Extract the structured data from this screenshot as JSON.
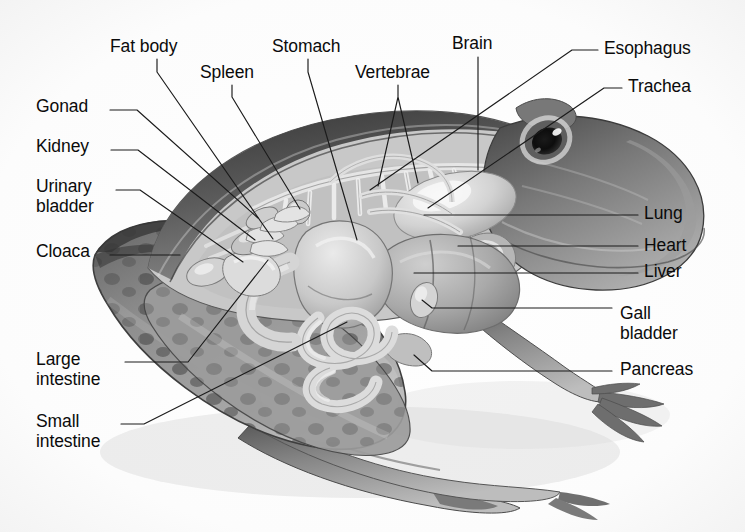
{
  "figure": {
    "view": "lateral dissection, facing right",
    "background_color": "#fdfdfd",
    "label_color": "#0b0b0b",
    "leader_color": "#1b1b1b",
    "style": "grayscale airbrush illustration"
  },
  "labels": [
    {
      "id": "fat-body",
      "text": "Fat body",
      "x": 110,
      "y": 36,
      "align": "left",
      "leader": "M 157 59 L 157 72 L 273 239"
    },
    {
      "id": "spleen",
      "text": "Spleen",
      "x": 200,
      "y": 62,
      "align": "left",
      "leader": "M 232 85 L 232 97 L 300 209"
    },
    {
      "id": "stomach",
      "text": "Stomach",
      "x": 272,
      "y": 36,
      "align": "left",
      "leader": "M 308 59 L 308 72 L 357 240"
    },
    {
      "id": "vertebrae",
      "text": "Vertebrae",
      "x": 355,
      "y": 62,
      "align": "left",
      "leader": "M 398 85 L 398 97 L 378 186 M 398 97 L 418 183"
    },
    {
      "id": "brain",
      "text": "Brain",
      "x": 452,
      "y": 33,
      "align": "left",
      "leader": "M 478 57 L 478 170"
    },
    {
      "id": "esophagus",
      "text": "Esophagus",
      "x": 604,
      "y": 38,
      "align": "left",
      "leader": "M 598 50 L 572 50 L 370 190"
    },
    {
      "id": "trachea",
      "text": "Trachea",
      "x": 628,
      "y": 76,
      "align": "left",
      "leader": "M 622 88 L 604 88 L 428 208"
    },
    {
      "id": "gonad",
      "text": "Gonad",
      "x": 36,
      "y": 96,
      "align": "left",
      "leader": "M 110 110 L 137 110 L 258 218"
    },
    {
      "id": "kidney",
      "text": "Kidney",
      "x": 36,
      "y": 136,
      "align": "left",
      "leader": "M 111 150 L 138 150 L 255 240"
    },
    {
      "id": "urinary-bladder",
      "text": "Urinary\nbladder",
      "x": 36,
      "y": 176,
      "align": "left",
      "leader": "M 116 190 L 140 190 L 243 262"
    },
    {
      "id": "cloaca",
      "text": "Cloaca",
      "x": 36,
      "y": 241,
      "align": "left",
      "leader": "M 110 255 L 180 255"
    },
    {
      "id": "large-intestine",
      "text": "Large\nintestine",
      "x": 36,
      "y": 349,
      "align": "left",
      "leader": "M 125 362 L 188 362 L 268 260"
    },
    {
      "id": "small-intestine",
      "text": "Small\nintestine",
      "x": 36,
      "y": 411,
      "align": "left",
      "leader": "M 121 424 L 144 424 L 347 322"
    },
    {
      "id": "lung",
      "text": "Lung",
      "x": 644,
      "y": 203,
      "align": "left",
      "leader": "M 638 215 L 424 215"
    },
    {
      "id": "heart",
      "text": "Heart",
      "x": 644,
      "y": 235,
      "align": "left",
      "leader": "M 638 246 L 458 246"
    },
    {
      "id": "liver",
      "text": "Liver",
      "x": 644,
      "y": 261,
      "align": "left",
      "leader": "M 638 273 L 414 273"
    },
    {
      "id": "gall-bladder",
      "text": "Gall\nbladder",
      "x": 620,
      "y": 303,
      "align": "left",
      "leader": "M 612 308 L 432 308 L 422 300"
    },
    {
      "id": "pancreas",
      "text": "Pancreas",
      "x": 620,
      "y": 359,
      "align": "left",
      "leader": "M 612 371 L 432 371 L 414 355"
    }
  ],
  "organs": [
    {
      "id": "brain",
      "name": "Brain"
    },
    {
      "id": "esophagus",
      "name": "Esophagus"
    },
    {
      "id": "trachea",
      "name": "Trachea"
    },
    {
      "id": "lung",
      "name": "Lung"
    },
    {
      "id": "heart",
      "name": "Heart"
    },
    {
      "id": "liver",
      "name": "Liver"
    },
    {
      "id": "gall-bladder",
      "name": "Gall bladder"
    },
    {
      "id": "pancreas",
      "name": "Pancreas"
    },
    {
      "id": "stomach",
      "name": "Stomach"
    },
    {
      "id": "spleen",
      "name": "Spleen"
    },
    {
      "id": "small-intestine",
      "name": "Small intestine"
    },
    {
      "id": "large-intestine",
      "name": "Large intestine"
    },
    {
      "id": "cloaca",
      "name": "Cloaca"
    },
    {
      "id": "urinary-bladder",
      "name": "Urinary bladder"
    },
    {
      "id": "kidney",
      "name": "Kidney"
    },
    {
      "id": "gonad",
      "name": "Gonad"
    },
    {
      "id": "fat-body",
      "name": "Fat body"
    },
    {
      "id": "vertebrae",
      "name": "Vertebrae"
    }
  ]
}
